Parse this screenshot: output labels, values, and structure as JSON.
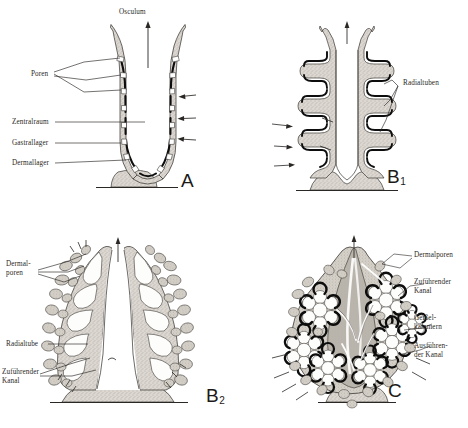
{
  "figure": {
    "type": "scientific-diagram",
    "background_color": "#ffffff",
    "ink_color": "#1a1a1a",
    "wall_fill_color": "#d8d4cd",
    "gastral_layer_color": "#111111"
  },
  "panels": [
    {
      "id": "A",
      "letter": "A",
      "letter_sub": "",
      "grade": "Ascon",
      "labels": [
        {
          "key": "osculum",
          "text": "Osculum",
          "position": "top-center"
        },
        {
          "key": "poren",
          "text": "Poren",
          "position": "left"
        },
        {
          "key": "zentralraum",
          "text": "Zentralraum",
          "position": "left"
        },
        {
          "key": "gastrallager",
          "text": "Gastrallager",
          "position": "left"
        },
        {
          "key": "dermallager",
          "text": "Dermallager",
          "position": "left"
        }
      ]
    },
    {
      "id": "B1",
      "letter": "B",
      "letter_sub": "1",
      "grade": "Sycon (erste Faltung)",
      "labels": [
        {
          "key": "radialtuben",
          "text": "Radialtuben",
          "position": "right"
        }
      ]
    },
    {
      "id": "B2",
      "letter": "B",
      "letter_sub": "2",
      "grade": "Sycon (fortgeschritten)",
      "labels": [
        {
          "key": "dermalporen_l1",
          "text": "Dermal-",
          "position": "left"
        },
        {
          "key": "dermalporen_l2",
          "text": "poren",
          "position": "left"
        },
        {
          "key": "radialtube",
          "text": "Radialtube",
          "position": "left"
        },
        {
          "key": "zufuehrender_l1",
          "text": "Zuführender",
          "position": "left"
        },
        {
          "key": "zufuehrender_l2",
          "text": "Kanal",
          "position": "left"
        }
      ]
    },
    {
      "id": "C",
      "letter": "C",
      "letter_sub": "",
      "grade": "Leucon",
      "labels": [
        {
          "key": "dermalporen",
          "text": "Dermalporen",
          "position": "right"
        },
        {
          "key": "zufuehrender_l1",
          "text": "Zuführender",
          "position": "right"
        },
        {
          "key": "zufuehrender_l2",
          "text": "Kanal",
          "position": "right"
        },
        {
          "key": "geissel_l1",
          "text": "Geißel-",
          "position": "right"
        },
        {
          "key": "geissel_l2",
          "text": "kammern",
          "position": "right"
        },
        {
          "key": "ausfuehrender_l1",
          "text": "Ausführen-",
          "position": "right"
        },
        {
          "key": "ausfuehrender_l2",
          "text": "der Kanal",
          "position": "right"
        }
      ]
    }
  ]
}
